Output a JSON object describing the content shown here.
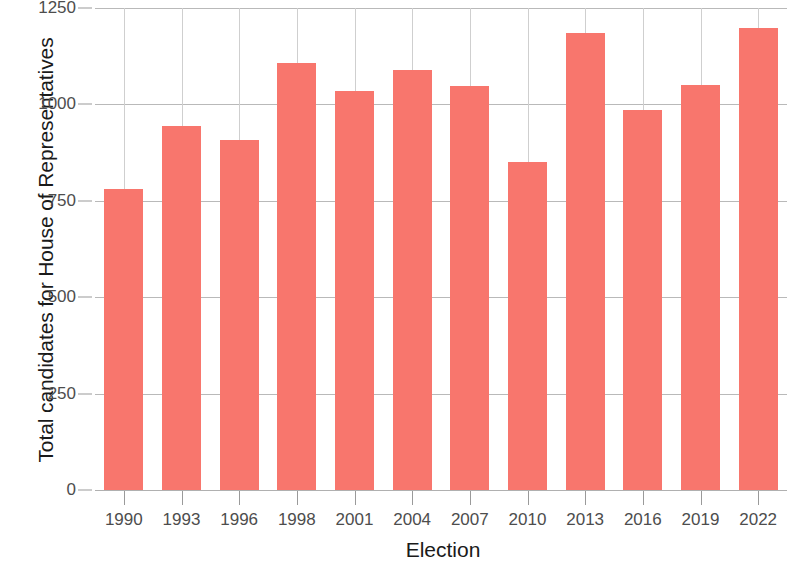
{
  "chart_data": {
    "type": "bar",
    "title": "",
    "subtitle": "",
    "xlabel": "Election",
    "ylabel": "Total candidates for House of Representatives",
    "categories": [
      "1990",
      "1993",
      "1996",
      "1998",
      "2001",
      "2004",
      "2007",
      "2010",
      "2013",
      "2016",
      "2019",
      "2022"
    ],
    "values": [
      781,
      945,
      908,
      1108,
      1034,
      1088,
      1048,
      850,
      1184,
      985,
      1050,
      1197
    ],
    "series": [
      {
        "name": "Total candidates",
        "values": [
          781,
          945,
          908,
          1108,
          1034,
          1088,
          1048,
          850,
          1184,
          985,
          1050,
          1197
        ]
      }
    ],
    "ylim": [
      0,
      1250
    ],
    "y_ticks": [
      0,
      250,
      500,
      750,
      1000,
      1250
    ],
    "y_tick_labels": [
      "0",
      "250",
      "500",
      "750",
      "1000",
      "1250"
    ],
    "x_tick_labels": [
      "1990",
      "1993",
      "1996",
      "1998",
      "2001",
      "2004",
      "2007",
      "2010",
      "2013",
      "2016",
      "2019",
      "2022"
    ],
    "grid": "major-horizontal-and-vertical",
    "legend": "none",
    "bar_color": "#f8766d",
    "gridline_color": "#b9b9b9",
    "axis_text_color": "#4d4d4d",
    "title_text_color": "#1a1a1a",
    "background_color": "#ffffff"
  },
  "axis": {
    "x_title": "Election",
    "y_title": "Total candidates for House of Representatives"
  }
}
